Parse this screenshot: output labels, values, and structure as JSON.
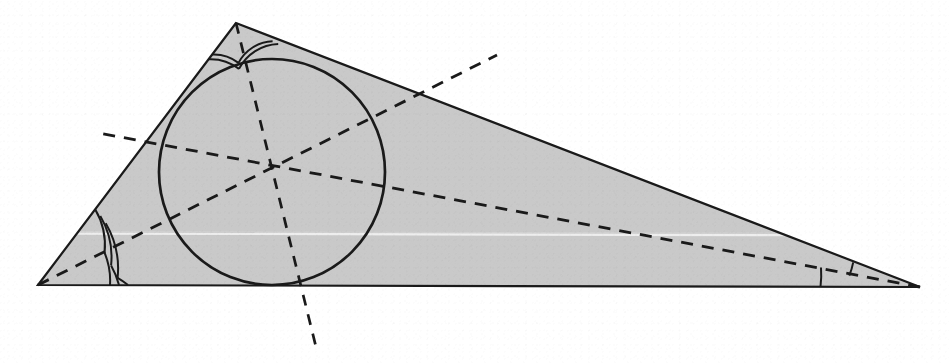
{
  "figure": {
    "kind": "geometry-diagram",
    "canvas": {
      "width": 949,
      "height": 364
    },
    "background_color": "#ffffff",
    "stroke_color": "#1a1a1a",
    "fill_color": "#c9c9c9",
    "scan_artifact_color": "#f2f2f2"
  },
  "triangle": {
    "name": "shaded-triangle",
    "vertices": [
      {
        "label": "top-vertex",
        "x": 236,
        "y": 23
      },
      {
        "label": "left-vertex",
        "x": 38,
        "y": 285
      },
      {
        "label": "right-vertex",
        "x": 920,
        "y": 287
      }
    ],
    "fill": "#c9c9c9",
    "stroke": "#1a1a1a",
    "stroke_width": 2.1
  },
  "incircle": {
    "name": "inscribed-circle",
    "center": {
      "x": 272,
      "y": 172
    },
    "radius": 113,
    "stroke": "#1a1a1a",
    "stroke_width": 2.6,
    "fill": "none"
  },
  "incenter": {
    "name": "incenter-point",
    "x": 272,
    "y": 172
  },
  "bisectors": [
    {
      "name": "bisector-from-top-vertex",
      "from": {
        "x": 236,
        "y": 23
      },
      "through_incenter": true,
      "to": {
        "x": 317,
        "y": 351
      },
      "dash": "11 9",
      "stroke": "#1a1a1a",
      "stroke_width": 2.7
    },
    {
      "name": "bisector-from-left-vertex",
      "from": {
        "x": 38,
        "y": 285
      },
      "through_incenter": true,
      "to": {
        "x": 497,
        "y": 55
      },
      "dash": "12 9",
      "stroke": "#1a1a1a",
      "stroke_width": 2.7
    },
    {
      "name": "bisector-from-right-vertex",
      "from": {
        "x": 920,
        "y": 287
      },
      "through_incenter": true,
      "to": {
        "x": 99,
        "y": 133
      },
      "dash": "12 9",
      "stroke": "#1a1a1a",
      "stroke_width": 2.7
    }
  ],
  "angle_marks": [
    {
      "name": "angle-mark-left-upper",
      "vertex": "left-vertex",
      "arcs": 3,
      "note": "upper half of bisected left angle"
    },
    {
      "name": "angle-mark-left-lower",
      "vertex": "left-vertex",
      "arcs": 3,
      "note": "lower half of bisected left angle"
    },
    {
      "name": "angle-mark-top-left",
      "vertex": "top-vertex",
      "arcs": 2,
      "note": "left half of bisected apex angle"
    },
    {
      "name": "angle-mark-top-right",
      "vertex": "top-vertex",
      "arcs": 2,
      "note": "right half of bisected apex angle"
    },
    {
      "name": "angle-mark-right-upper",
      "vertex": "right-vertex",
      "arcs": 1,
      "note": "upper half of bisected right angle"
    },
    {
      "name": "angle-mark-right-lower",
      "vertex": "right-vertex",
      "arcs": 1,
      "note": "lower half of bisected right angle"
    }
  ],
  "chart_data": {
    "type": "scatter",
    "xlabel": "",
    "ylabel": "",
    "xlim": [
      0,
      949
    ],
    "ylim": [
      364,
      0
    ],
    "grid": false,
    "legend": "none",
    "annotations": [
      "triangle vertices: (236,23), (38,285), (920,287)",
      "incircle center (272,172) radius 113",
      "three angle bisectors concurrent at the incenter",
      "angle arcs: 3 + 3 at left vertex, 2 + 2 at apex, 1 + 1 at right vertex"
    ],
    "series": [
      {
        "name": "triangle-vertices",
        "x": [
          236,
          38,
          920
        ],
        "y": [
          23,
          285,
          287
        ]
      },
      {
        "name": "incenter",
        "x": [
          272
        ],
        "y": [
          172
        ]
      }
    ]
  }
}
